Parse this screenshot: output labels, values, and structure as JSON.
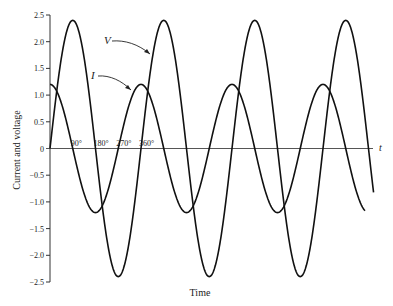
{
  "chart_data": {
    "type": "line",
    "title": "",
    "xlabel": "Time",
    "ylabel": "Current and voltage",
    "x_axis_end_label": "t",
    "ylim": [
      -2.5,
      2.5
    ],
    "yticks": [
      -2.5,
      -2.0,
      -1.5,
      -1.0,
      -0.5,
      0,
      0.5,
      1.0,
      1.5,
      2.0,
      2.5
    ],
    "ytick_labels": [
      "−2.5",
      "−2.0",
      "−1.5",
      "−1.0",
      "−0.5",
      "0",
      "0.5",
      "1.0",
      "1.5",
      "2.0",
      "2.5"
    ],
    "x_unit": "degrees",
    "x_markers": [
      {
        "deg": 90,
        "label": "90°"
      },
      {
        "deg": 180,
        "label": "180°"
      },
      {
        "deg": 270,
        "label": "270°"
      },
      {
        "deg": 360,
        "label": "360°"
      }
    ],
    "x_range_deg": [
      0,
      1280
    ],
    "grid": false,
    "series": [
      {
        "name": "V",
        "label": "V",
        "function": "2.4*sin(theta)",
        "amplitude": 2.4,
        "phase_deg": 0,
        "end_deg": 1280
      },
      {
        "name": "I",
        "label": "I",
        "function": "1.2*cos(theta)",
        "amplitude": 1.2,
        "phase_deg": 90,
        "end_deg": 1246
      }
    ],
    "annotations": [
      {
        "text": "V",
        "points_to": "V curve"
      },
      {
        "text": "I",
        "points_to": "I curve"
      }
    ]
  },
  "labels": {
    "xlabel": "Time",
    "ylabel": "Current and voltage",
    "t": "t",
    "V": "V",
    "I": "I"
  }
}
